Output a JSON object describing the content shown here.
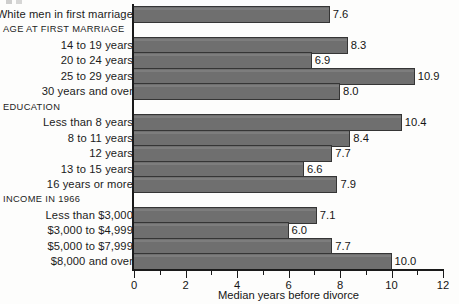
{
  "chart_data": {
    "type": "bar",
    "orientation": "horizontal",
    "title": "",
    "xlabel": "Median years before divorce",
    "ylabel": "",
    "xlim": [
      0,
      12
    ],
    "xticks": [
      0,
      2,
      4,
      6,
      8,
      10,
      12
    ],
    "xtick_labels": [
      "0",
      "2",
      "4",
      "6",
      "8",
      "10",
      "12"
    ],
    "minor_xticks": [
      1,
      3,
      5,
      7,
      9,
      11
    ],
    "grid": false,
    "legend": null,
    "bar_color": "#6f6f6f",
    "bar_edge_color": "#353535",
    "background_color": "#fdfdfc",
    "rows": [
      {
        "kind": "bar",
        "label": "White men in first marriage",
        "value": 7.6,
        "value_label": "7.6"
      },
      {
        "kind": "header",
        "label": "AGE AT FIRST MARRIAGE",
        "value": null,
        "value_label": ""
      },
      {
        "kind": "bar",
        "label": "14 to 19 years",
        "value": 8.3,
        "value_label": "8.3"
      },
      {
        "kind": "bar",
        "label": "20 to 24 years",
        "value": 6.9,
        "value_label": "6.9"
      },
      {
        "kind": "bar",
        "label": "25 to 29 years",
        "value": 10.9,
        "value_label": "10.9"
      },
      {
        "kind": "bar",
        "label": "30 years and over",
        "value": 8.0,
        "value_label": "8.0"
      },
      {
        "kind": "header",
        "label": "EDUCATION",
        "value": null,
        "value_label": ""
      },
      {
        "kind": "bar",
        "label": "Less than 8 years",
        "value": 10.4,
        "value_label": "10.4"
      },
      {
        "kind": "bar",
        "label": "8 to 11 years",
        "value": 8.4,
        "value_label": "8.4"
      },
      {
        "kind": "bar",
        "label": "12 years",
        "value": 7.7,
        "value_label": "7.7"
      },
      {
        "kind": "bar",
        "label": "13 to 15 years",
        "value": 6.6,
        "value_label": "6.6"
      },
      {
        "kind": "bar",
        "label": "16 years or more",
        "value": 7.9,
        "value_label": "7.9"
      },
      {
        "kind": "header",
        "label": "INCOME IN 1966",
        "value": null,
        "value_label": ""
      },
      {
        "kind": "bar",
        "label": "Less than $3,000",
        "value": 7.1,
        "value_label": "7.1"
      },
      {
        "kind": "bar",
        "label": "$3,000 to $4,999",
        "value": 6.0,
        "value_label": "6.0"
      },
      {
        "kind": "bar",
        "label": "$5,000 to $7,999",
        "value": 7.7,
        "value_label": "7.7"
      },
      {
        "kind": "bar",
        "label": "$8,000 and over",
        "value": 10.0,
        "value_label": "10.0"
      }
    ]
  }
}
